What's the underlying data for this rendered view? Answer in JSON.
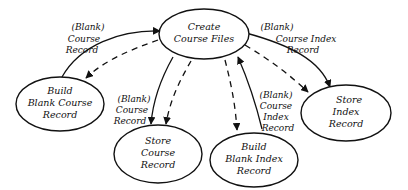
{
  "diagram": {
    "type": "data-flow",
    "nodes": {
      "create": {
        "lines": [
          "Create",
          "Course Files"
        ]
      },
      "build_course": {
        "lines": [
          "Build",
          "Blank Course",
          "Record"
        ]
      },
      "store_course": {
        "lines": [
          "Store",
          "Course",
          "Record"
        ]
      },
      "build_index": {
        "lines": [
          "Build",
          "Blank Index",
          "Record"
        ]
      },
      "store_index": {
        "lines": [
          "Store",
          "Index",
          "Record"
        ]
      }
    },
    "edges": {
      "create_to_build_course_label": {
        "lines": [
          "(Blank)",
          "Course",
          "Record"
        ]
      },
      "create_to_store_index_label": {
        "lines": [
          "(Blank)",
          "Course Index",
          "Record"
        ]
      },
      "create_to_store_course_label": {
        "lines": [
          "(Blank)",
          "Course",
          "Record"
        ]
      },
      "build_index_to_create_label": {
        "lines": [
          "(Blank)",
          "Course",
          "Index",
          "Record"
        ]
      }
    },
    "colors": {
      "stroke": "#111111",
      "background": "#ffffff"
    }
  }
}
